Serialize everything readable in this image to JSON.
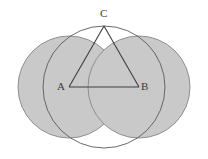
{
  "figure": {
    "type": "geometric-diagram",
    "canvas": {
      "width": 208,
      "height": 159
    },
    "colors": {
      "background": "#ffffff",
      "circle_fill": "#c9c9c9",
      "circle_stroke": "#8f8f8f",
      "lens_arc_stroke": "#5a5a5a",
      "triangle_stroke": "#3f3f3f",
      "label_color": "#3a3a3a"
    },
    "circles": [
      {
        "name": "left-circle",
        "center_label": "A",
        "cx": 69,
        "cy": 87,
        "r": 51
      },
      {
        "name": "right-circle",
        "center_label": "B",
        "cx": 139,
        "cy": 87,
        "r": 51
      }
    ],
    "points": [
      {
        "id": "A",
        "label": "A",
        "x": 69,
        "y": 87
      },
      {
        "id": "B",
        "label": "B",
        "x": 139,
        "y": 87
      },
      {
        "id": "C",
        "label": "C",
        "x": 104,
        "y": 26
      }
    ],
    "segments": [
      {
        "name": "segment-AB",
        "from": "A",
        "to": "B"
      },
      {
        "name": "segment-AC",
        "from": "A",
        "to": "C"
      },
      {
        "name": "segment-BC",
        "from": "B",
        "to": "C"
      }
    ],
    "labels": {
      "a": "A",
      "b": "B",
      "c": "C"
    }
  }
}
